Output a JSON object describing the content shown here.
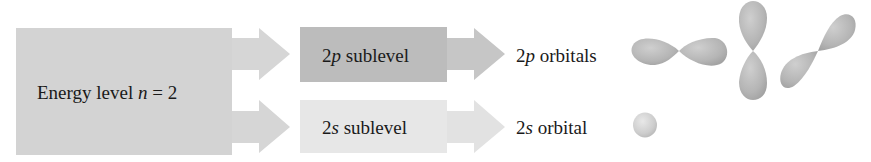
{
  "diagram": {
    "colors": {
      "energy_box": "#d3d3d3",
      "energy_arrow": "#d6d6d6",
      "sublevel_p_box": "#bcbcbc",
      "sublevel_p_arrow": "#c6c6c6",
      "sublevel_s_box": "#e7e7e7",
      "sublevel_s_arrow": "#e2e2e2",
      "orbital_fill": "#b9b9b9",
      "text": "#1a1a1a"
    },
    "energy_level": {
      "prefix": "Energy level ",
      "var": "n",
      "suffix": " = 2"
    },
    "sublevels": [
      {
        "num": "2",
        "letter": "p",
        "suffix": " sublevel"
      },
      {
        "num": "2",
        "letter": "s",
        "suffix": " sublevel"
      }
    ],
    "orbital_labels": [
      {
        "num": "2",
        "letter": "p",
        "suffix": " orbitals"
      },
      {
        "num": "2",
        "letter": "s",
        "suffix": " orbital"
      }
    ],
    "orbital_shapes": [
      {
        "type": "p",
        "orientation": "horizontal"
      },
      {
        "type": "p",
        "orientation": "vertical"
      },
      {
        "type": "p",
        "orientation": "diagonal"
      },
      {
        "type": "s",
        "orientation": "sphere"
      }
    ]
  }
}
